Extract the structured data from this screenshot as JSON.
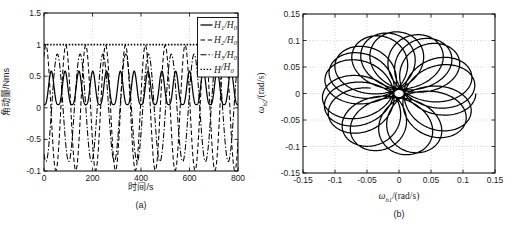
{
  "figure": {
    "background": "#ffffff",
    "line_color": "#000000",
    "grid_color": "#c5c5c5"
  },
  "chart_data": [
    {
      "id": "a",
      "type": "line",
      "title": "",
      "xlabel": "时间/s",
      "ylabel": "角动量/Nms",
      "sublabel": "(a)",
      "xlim": [
        0,
        800
      ],
      "ylim": [
        -1,
        1.5
      ],
      "xtick_values": [
        0,
        200,
        400,
        600,
        800
      ],
      "xtick_labels": [
        "0",
        "200",
        "400",
        "600",
        "800"
      ],
      "ytick_values": [
        1.5,
        1,
        0.5,
        0,
        -0.5,
        -1
      ],
      "ytick_labels": [
        "1.5",
        "1",
        "0.5",
        "0",
        "-0.5",
        "-0.1"
      ],
      "grid": true,
      "legend_position": "top-right",
      "series": [
        {
          "label": "H1/H0",
          "label_parts": {
            "p1": "H",
            "s1": "1",
            "p2": "/H",
            "s2": "0"
          },
          "style": "solid",
          "model": {
            "kind": "pulse",
            "base": 0.05,
            "amp": 0.53,
            "period": 57,
            "t_peak": 30,
            "sharpness": 3
          }
        },
        {
          "label": "H2/H0",
          "label_parts": {
            "p1": "H",
            "s1": "2",
            "p2": "/H",
            "s2": "0"
          },
          "style": "dashed",
          "model": {
            "kind": "cosine",
            "amp": 0.99,
            "period": 82,
            "t_peak": 8
          }
        },
        {
          "label": "H3/H0",
          "label_parts": {
            "p1": "H",
            "s1": "3",
            "p2": "/H",
            "s2": "0"
          },
          "style": "dashdot",
          "model": {
            "kind": "cosine",
            "amp": 0.85,
            "period": 94,
            "t_peak": 55
          }
        },
        {
          "label": "H/H0",
          "label_parts": {
            "p1": "H",
            "s1": "",
            "p2": "/H",
            "s2": "0"
          },
          "style": "dotted",
          "model": {
            "kind": "const",
            "value": 1
          }
        }
      ]
    },
    {
      "id": "b",
      "type": "line",
      "title": "",
      "xlabel": "ω_h1/(rad/s)",
      "xlabel_parts": {
        "pre": "ω",
        "sub": "h1",
        "post": "/(rad/s)"
      },
      "ylabel": "ω_h2/(rad/s)",
      "ylabel_parts": {
        "pre": "ω",
        "sub": "h2",
        "post": "/(rad/s)"
      },
      "sublabel": "(b)",
      "xlim": [
        -0.15,
        0.15
      ],
      "ylim": [
        -0.15,
        0.15
      ],
      "xtick_values": [
        -0.15,
        -0.1,
        -0.05,
        0,
        0.05,
        0.1,
        0.15
      ],
      "xtick_labels": [
        "-0.15",
        "-0.1",
        "-0.05",
        "0",
        "0.05",
        "0.1",
        "0.15"
      ],
      "ytick_values": [
        -0.15,
        -0.1,
        -0.05,
        0,
        0.05,
        0.1,
        0.15
      ],
      "ytick_labels": [
        "-0.15",
        "-0.1",
        "-0.05",
        "0",
        "0.05",
        "0.1",
        "0.15"
      ],
      "grid": true,
      "trajectory_model": {
        "kind": "rosette",
        "a": 0.064,
        "b": 0.056,
        "w1": 1,
        "w2": 6.76,
        "t_max": 16.5,
        "samples": 2600,
        "y_scale": 0.97,
        "r_min": 0.008,
        "r_max": 0.12
      }
    }
  ]
}
